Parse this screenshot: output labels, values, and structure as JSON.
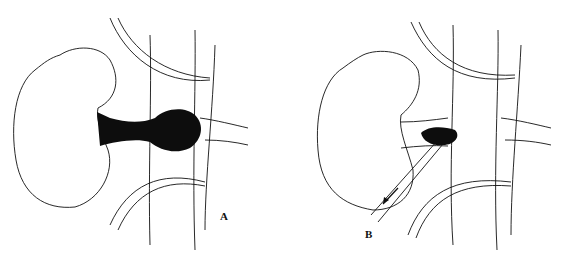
{
  "figure": {
    "panels": [
      {
        "id": "A",
        "label": "A",
        "description": "Kidney with dark thrombus extending through renal vein into vena cava"
      },
      {
        "id": "B",
        "label": "B",
        "description": "Renal vein opened with instrument (catheter) extracting thrombus, arrow indicating withdrawal direction"
      }
    ],
    "colors": {
      "ink": "#111111",
      "background": "#ffffff",
      "thrombus": "#0d0d0d"
    }
  }
}
